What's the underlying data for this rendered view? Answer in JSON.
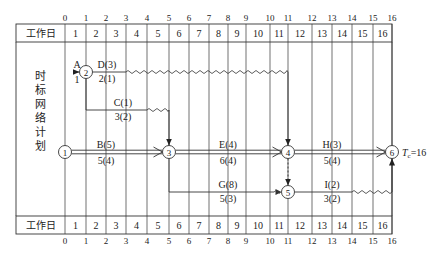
{
  "diagram": {
    "title_vertical": [
      "时",
      "标",
      "网",
      "络",
      "计",
      "划"
    ],
    "row_header_label": "工作日",
    "column_ticks": [
      "0",
      "1",
      "2",
      "3",
      "4",
      "5",
      "6",
      "7",
      "8",
      "9",
      "10",
      "11",
      "12",
      "13",
      "14",
      "15",
      "16"
    ],
    "day_cells": [
      "1",
      "2",
      "3",
      "4",
      "5",
      "6",
      "7",
      "8",
      "9",
      "10",
      "11",
      "12",
      "13",
      "14",
      "15",
      "16"
    ],
    "grid_x": [
      65,
      86,
      106,
      126,
      147,
      169,
      189,
      209,
      228,
      246,
      270,
      288,
      312,
      332,
      352,
      373,
      392
    ],
    "nodes": [
      {
        "id": "1",
        "x": 65,
        "y": 152
      },
      {
        "id": "2",
        "x": 86,
        "y": 72
      },
      {
        "id": "3",
        "x": 169,
        "y": 152
      },
      {
        "id": "4",
        "x": 288,
        "y": 152
      },
      {
        "id": "5",
        "x": 288,
        "y": 192
      },
      {
        "id": "6",
        "x": 392,
        "y": 152
      }
    ],
    "activities": [
      {
        "name": "A",
        "top": "A",
        "bottom": "1",
        "from": "start",
        "to": "2"
      },
      {
        "name": "D",
        "top": "D(3)",
        "bottom": "2(1)",
        "from": "2",
        "to": "4",
        "free_float_wave_to_day": 11
      },
      {
        "name": "C",
        "top": "C(1)",
        "bottom": "3(2)",
        "from": "2",
        "to": "3"
      },
      {
        "name": "B",
        "top": "B(5)",
        "bottom": "5(4)",
        "from": "1",
        "to": "3",
        "critical": true
      },
      {
        "name": "E",
        "top": "E(4)",
        "bottom": "6(4)",
        "from": "3",
        "to": "4",
        "critical": true
      },
      {
        "name": "H",
        "top": "H(3)",
        "bottom": "5(4)",
        "from": "4",
        "to": "6",
        "critical": true
      },
      {
        "name": "G",
        "top": "G(8)",
        "bottom": "5(3)",
        "from": "3",
        "to": "5"
      },
      {
        "name": "I",
        "top": "I(2)",
        "bottom": "3(2)",
        "from": "5",
        "to": "6"
      }
    ],
    "dummy": {
      "from": "4",
      "to": "5",
      "style": "dashed"
    },
    "total_duration_label": "Tc=16",
    "total_duration_var": "T",
    "total_duration_sub": "c",
    "total_duration_value": "=16"
  }
}
